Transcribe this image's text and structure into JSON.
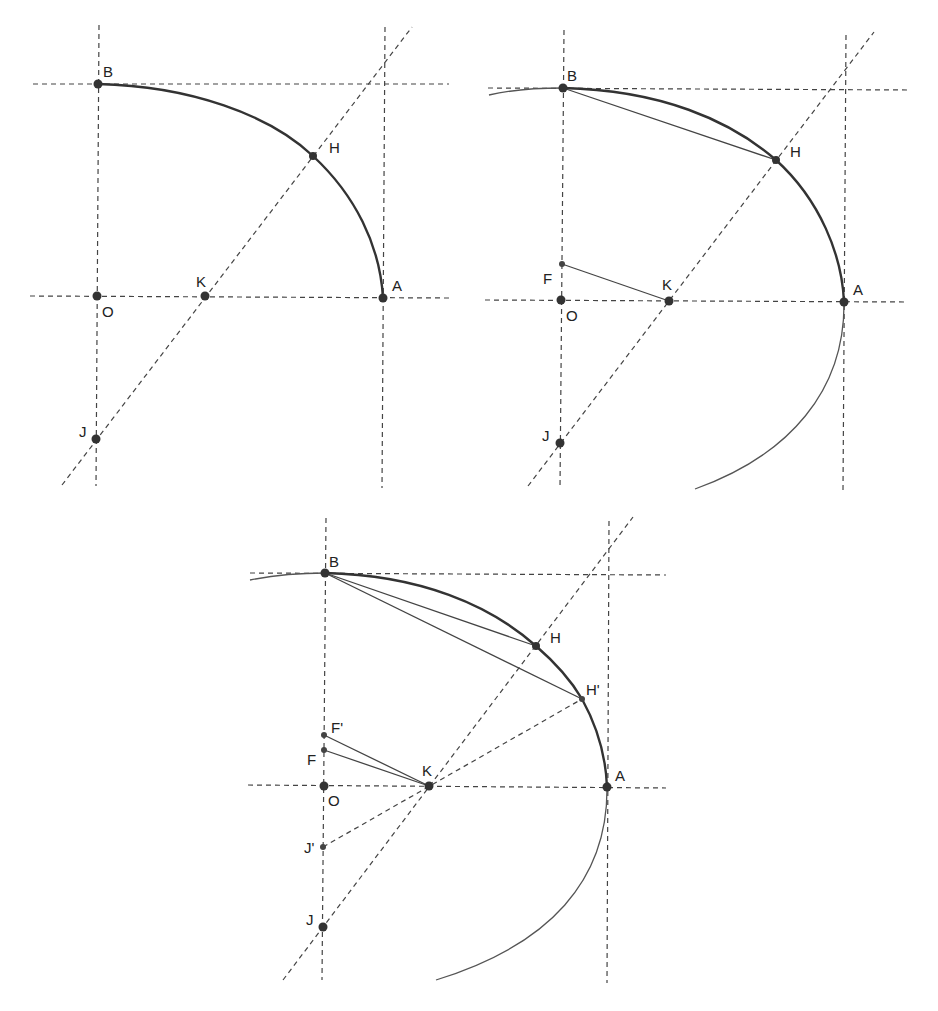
{
  "figure": {
    "colors": {
      "line": "#444444",
      "curve": "#333333",
      "point": "#333333",
      "background": "#ffffff"
    }
  },
  "diagram1": {
    "labels": {
      "B": "B",
      "H": "H",
      "K": "K",
      "A": "A",
      "O": "O",
      "J": "J"
    }
  },
  "diagram2": {
    "labels": {
      "B": "B",
      "H": "H",
      "F": "F",
      "K": "K",
      "A": "A",
      "O": "O",
      "J": "J"
    }
  },
  "diagram3": {
    "labels": {
      "B": "B",
      "H": "H",
      "Hp": "H'",
      "Fp": "F'",
      "F": "F",
      "K": "K",
      "A": "A",
      "O": "O",
      "Jp": "J'",
      "J": "J"
    }
  }
}
